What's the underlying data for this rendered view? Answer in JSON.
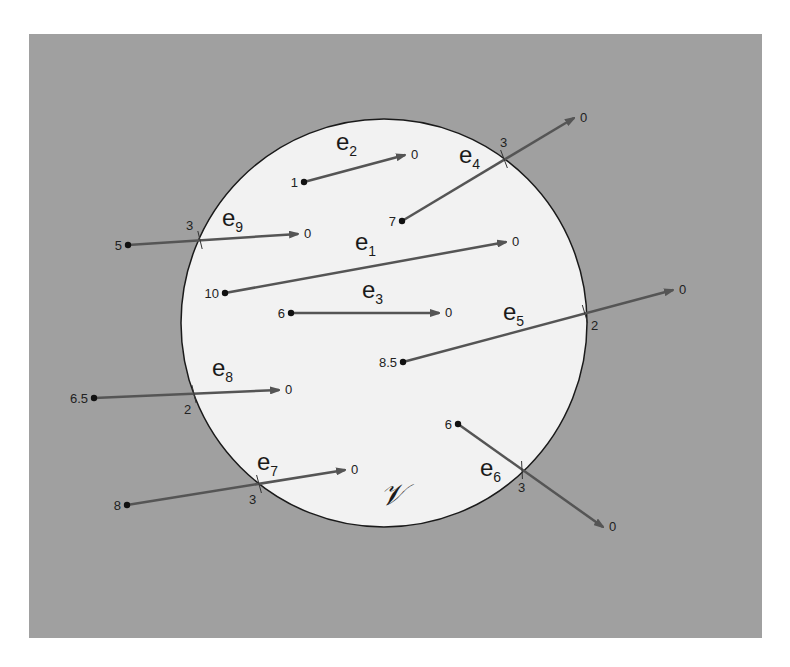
{
  "figure": {
    "background_color": "#a0a0a0",
    "region_fill": "#f2f2f2",
    "edge_color": "#555555",
    "region": {
      "label": "𝒱",
      "cx": 384,
      "cy": 323,
      "rx": 203,
      "ry": 204
    },
    "frame": {
      "x": 29,
      "y": 34,
      "width": 733,
      "height": 604
    }
  },
  "edges": [
    {
      "name": "e1",
      "base": "e",
      "sub": "1",
      "start": [
        225,
        293
      ],
      "end": [
        506,
        242
      ],
      "start_value": "10",
      "end_value": "0",
      "crossing": null,
      "label_pos": [
        355,
        250
      ]
    },
    {
      "name": "e2",
      "base": "e",
      "sub": "2",
      "start": [
        304,
        182
      ],
      "end": [
        405,
        155
      ],
      "start_value": "1",
      "end_value": "0",
      "crossing": null,
      "label_pos": [
        336,
        150
      ]
    },
    {
      "name": "e3",
      "base": "e",
      "sub": "3",
      "start": [
        291,
        313
      ],
      "end": [
        439,
        313
      ],
      "start_value": "6",
      "end_value": "0",
      "crossing": null,
      "label_pos": [
        362,
        298
      ]
    },
    {
      "name": "e4",
      "base": "e",
      "sub": "4",
      "start": [
        402,
        221
      ],
      "end": [
        574,
        118
      ],
      "start_value": "7",
      "end_value": "0",
      "crossing": {
        "point": [
          504,
          159
        ],
        "value": "3"
      },
      "label_pos": [
        459,
        163
      ]
    },
    {
      "name": "e5",
      "base": "e",
      "sub": "5",
      "start": [
        403,
        362
      ],
      "end": [
        673,
        290
      ],
      "start_value": "8.5",
      "end_value": "0",
      "crossing": {
        "point": [
          585,
          314
        ],
        "value": "2"
      },
      "label_pos": [
        503,
        320
      ]
    },
    {
      "name": "e6",
      "base": "e",
      "sub": "6",
      "start": [
        458,
        424
      ],
      "end": [
        603,
        527
      ],
      "start_value": "6",
      "end_value": "0",
      "crossing": {
        "point": [
          522,
          470
        ],
        "value": "3"
      },
      "label_pos": [
        480,
        476
      ]
    },
    {
      "name": "e7",
      "base": "e",
      "sub": "7",
      "start": [
        127,
        505
      ],
      "end": [
        345,
        470
      ],
      "start_value": "8",
      "end_value": "0",
      "crossing": {
        "point": [
          259,
          484
        ],
        "value": "3"
      },
      "label_pos": [
        257,
        470
      ]
    },
    {
      "name": "e8",
      "base": "e",
      "sub": "8",
      "start": [
        94,
        398
      ],
      "end": [
        279,
        390
      ],
      "start_value": "6.5",
      "end_value": "0",
      "crossing": {
        "point": [
          194,
          394
        ],
        "value": "2"
      },
      "label_pos": [
        212,
        376
      ]
    },
    {
      "name": "e9",
      "base": "e",
      "sub": "9",
      "start": [
        128,
        245
      ],
      "end": [
        298,
        234
      ],
      "start_value": "5",
      "end_value": "0",
      "crossing": {
        "point": [
          200,
          240
        ],
        "value": "3"
      },
      "label_pos": [
        222,
        226
      ]
    }
  ]
}
